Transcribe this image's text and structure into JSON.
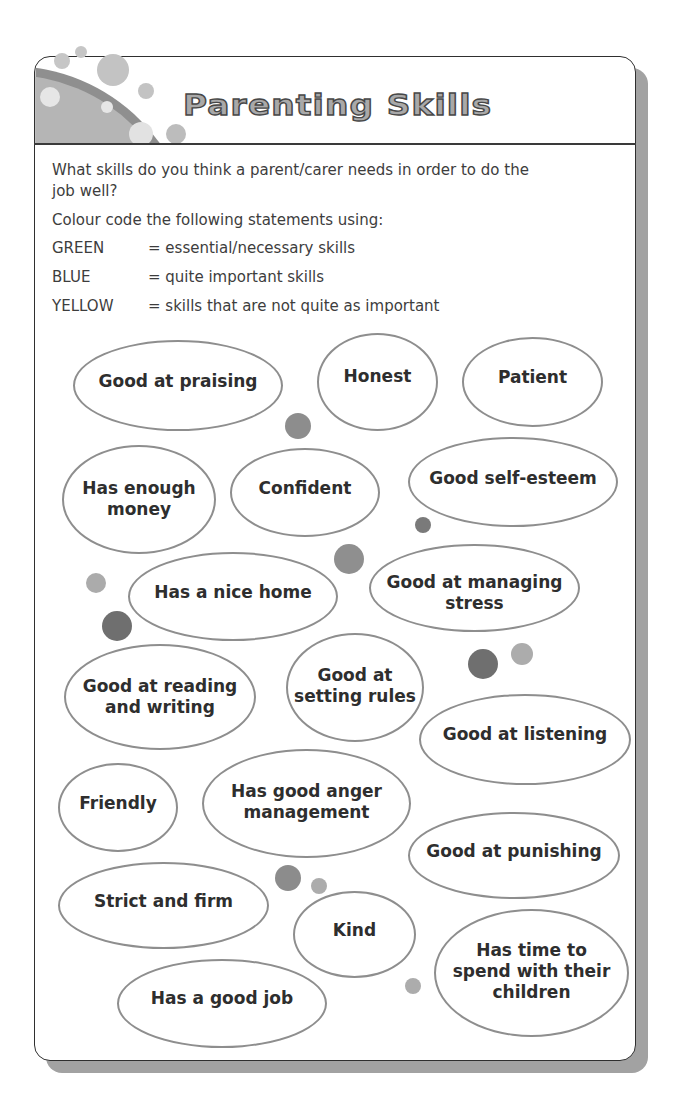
{
  "header": {
    "title": "Parenting Skills"
  },
  "intro": {
    "question_lines": [
      "What skills do you think a parent/carer needs in order to do the",
      "job well?"
    ],
    "instruction": "Colour code the following statements using:",
    "legend": [
      {
        "label": "GREEN",
        "meaning": "= essential/necessary skills"
      },
      {
        "label": "BLUE",
        "meaning": "= quite important skills"
      },
      {
        "label": "YELLOW",
        "meaning": "= skills that are not quite as important"
      }
    ]
  },
  "bubbles": [
    {
      "lines": [
        "Good at praising"
      ]
    },
    {
      "lines": [
        "Honest"
      ]
    },
    {
      "lines": [
        "Patient"
      ]
    },
    {
      "lines": [
        "Has enough",
        "money"
      ]
    },
    {
      "lines": [
        "Confident"
      ]
    },
    {
      "lines": [
        "Good self-esteem"
      ]
    },
    {
      "lines": [
        "Has a nice home"
      ]
    },
    {
      "lines": [
        "Good at managing",
        "stress"
      ]
    },
    {
      "lines": [
        "Good at reading",
        "and writing"
      ]
    },
    {
      "lines": [
        "Good at",
        "setting rules"
      ]
    },
    {
      "lines": [
        "Good at listening"
      ]
    },
    {
      "lines": [
        "Friendly"
      ]
    },
    {
      "lines": [
        "Has good anger",
        "management"
      ]
    },
    {
      "lines": [
        "Good at punishing"
      ]
    },
    {
      "lines": [
        "Strict and firm"
      ]
    },
    {
      "lines": [
        "Kind"
      ]
    },
    {
      "lines": [
        "Has time to",
        "spend with their",
        "children"
      ]
    },
    {
      "lines": [
        "Has a good job"
      ]
    }
  ]
}
